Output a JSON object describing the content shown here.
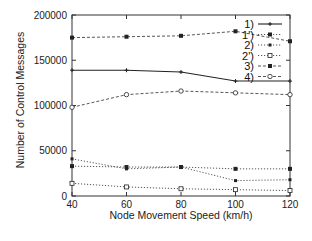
{
  "chart_data": {
    "type": "line",
    "title": "",
    "xlabel": "Node Movement Speed (km/h)",
    "ylabel": "Number of Control Messages",
    "x": [
      40,
      60,
      80,
      100,
      120
    ],
    "xlim": [
      40,
      120
    ],
    "ylim": [
      0,
      200000
    ],
    "xticks": [
      "40",
      "60",
      "80",
      "100",
      "120"
    ],
    "yticks": [
      "0",
      "50000",
      "100000",
      "150000",
      "200000"
    ],
    "grid": false,
    "legend_position": "top-right",
    "series": [
      {
        "name": "1)",
        "style": "solid",
        "marker": "plus",
        "values": [
          139000,
          139000,
          137000,
          127000,
          127000
        ]
      },
      {
        "name": "1')",
        "style": "dotted",
        "marker": "filled-square",
        "values": [
          33000,
          32000,
          32000,
          30000,
          30000
        ]
      },
      {
        "name": "2)",
        "style": "dotted",
        "marker": "filled-square-small",
        "values": [
          41000,
          30000,
          32000,
          17000,
          18000
        ]
      },
      {
        "name": "2')",
        "style": "dotted",
        "marker": "open-square",
        "values": [
          14000,
          10000,
          8000,
          7000,
          6000
        ]
      },
      {
        "name": "3)",
        "style": "dashed",
        "marker": "filled-square",
        "values": [
          175000,
          176000,
          177000,
          182000,
          171000
        ]
      },
      {
        "name": "4)",
        "style": "dashed",
        "marker": "open-circle",
        "values": [
          98000,
          112000,
          116000,
          114000,
          112000
        ]
      }
    ]
  }
}
